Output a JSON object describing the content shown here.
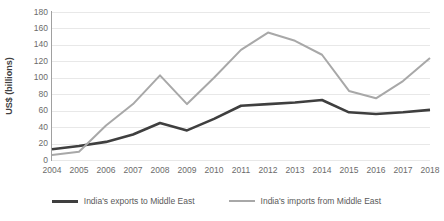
{
  "chart_data": {
    "type": "line",
    "title": "",
    "subtitle": "",
    "xlabel": "",
    "ylabel": "US$ (billions)",
    "categories": [
      "2004",
      "2005",
      "2006",
      "2007",
      "2008",
      "2009",
      "2010",
      "2011",
      "2012",
      "2013",
      "2014",
      "2015",
      "2016",
      "2017",
      "2018"
    ],
    "x": [
      2004,
      2005,
      2006,
      2007,
      2008,
      2009,
      2010,
      2011,
      2012,
      2013,
      2014,
      2015,
      2016,
      2017,
      2018
    ],
    "ylim": [
      0,
      180
    ],
    "ytick_step": 20,
    "ytick_labels": [
      "0",
      "20",
      "40",
      "60",
      "80",
      "100",
      "120",
      "140",
      "160",
      "180"
    ],
    "grid": true,
    "grid_axis": "y",
    "legend_position": "bottom",
    "series": [
      {
        "name": "India's exports to Middle East",
        "color": "#3f3f3f",
        "width": 2.6,
        "values": [
          13,
          17,
          22,
          31,
          45,
          36,
          50,
          66,
          68,
          70,
          73,
          58,
          56,
          58,
          61
        ]
      },
      {
        "name": "India's imports from Middle East",
        "color": "#a8a8a8",
        "width": 2.0,
        "values": [
          6,
          10,
          42,
          68,
          103,
          68,
          100,
          134,
          155,
          145,
          128,
          84,
          75,
          96,
          124
        ]
      }
    ]
  },
  "axes": {
    "y_title": "US$ (billions)",
    "y_ticks": [
      "180",
      "160",
      "140",
      "120",
      "100",
      "80",
      "60",
      "40",
      "20",
      "0"
    ],
    "x_ticks": [
      "2004",
      "2005",
      "2006",
      "2007",
      "2008",
      "2009",
      "2010",
      "2011",
      "2012",
      "2013",
      "2014",
      "2015",
      "2016",
      "2017",
      "2018"
    ]
  },
  "legend": {
    "items": [
      {
        "label": "India's exports to Middle East",
        "color": "#3f3f3f"
      },
      {
        "label": "India's imports from Middle East",
        "color": "#a8a8a8"
      }
    ]
  },
  "colors": {
    "exports_line": "#3f3f3f",
    "imports_line": "#a8a8a8",
    "gridline": "#e8e8e8",
    "axis": "#a0a0a0",
    "tick_text": "#6b6b6b",
    "title_text": "#404040",
    "background": "#ffffff"
  }
}
